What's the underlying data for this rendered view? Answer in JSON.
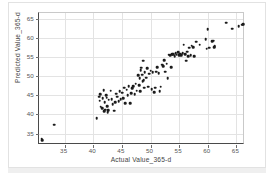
{
  "chart_data": {
    "type": "scatter",
    "title": "",
    "xlabel": "Actual Value_365-d",
    "ylabel": "Predicted Value_365-d",
    "xlim": [
      30.5,
      66.5
    ],
    "ylim": [
      32.0,
      66.5
    ],
    "xticks": [
      35,
      40,
      45,
      50,
      55,
      60,
      65
    ],
    "yticks": [
      35,
      40,
      45,
      50,
      55,
      60,
      65
    ],
    "grid": true,
    "legend": "none",
    "marker": "filled-circle",
    "marker_color": "#1b1b1b",
    "points": [
      [
        31.0,
        33.6
      ],
      [
        31.1,
        33.3
      ],
      [
        33.2,
        37.3
      ],
      [
        40.6,
        39.0
      ],
      [
        41.0,
        44.6
      ],
      [
        41.1,
        43.6
      ],
      [
        41.2,
        45.2
      ],
      [
        41.3,
        42.0
      ],
      [
        41.5,
        41.6
      ],
      [
        41.6,
        44.2
      ],
      [
        41.8,
        46.3
      ],
      [
        41.9,
        40.9
      ],
      [
        42.0,
        43.2
      ],
      [
        42.1,
        41.2
      ],
      [
        42.2,
        45.0
      ],
      [
        42.3,
        44.4
      ],
      [
        42.4,
        42.2
      ],
      [
        42.5,
        40.6
      ],
      [
        42.6,
        41.1
      ],
      [
        42.7,
        43.8
      ],
      [
        43.0,
        46.2
      ],
      [
        43.2,
        44.0
      ],
      [
        43.4,
        42.6
      ],
      [
        43.6,
        41.0
      ],
      [
        43.8,
        43.2
      ],
      [
        44.0,
        45.4
      ],
      [
        44.2,
        44.6
      ],
      [
        44.4,
        43.4
      ],
      [
        44.6,
        46.0
      ],
      [
        44.8,
        44.0
      ],
      [
        45.0,
        45.7
      ],
      [
        45.2,
        44.3
      ],
      [
        45.4,
        47.0
      ],
      [
        45.6,
        43.0
      ],
      [
        45.8,
        46.5
      ],
      [
        46.0,
        45.0
      ],
      [
        46.2,
        47.4
      ],
      [
        46.4,
        42.9
      ],
      [
        46.6,
        45.6
      ],
      [
        46.8,
        46.8
      ],
      [
        47.0,
        47.3
      ],
      [
        47.2,
        45.2
      ],
      [
        47.4,
        48.0
      ],
      [
        47.6,
        46.2
      ],
      [
        47.8,
        50.2
      ],
      [
        48.0,
        47.6
      ],
      [
        48.1,
        49.4
      ],
      [
        48.2,
        46.0
      ],
      [
        48.3,
        51.6
      ],
      [
        48.4,
        52.2
      ],
      [
        48.5,
        50.4
      ],
      [
        48.6,
        48.6
      ],
      [
        48.7,
        54.0
      ],
      [
        48.8,
        49.0
      ],
      [
        48.9,
        47.0
      ],
      [
        49.0,
        51.0
      ],
      [
        49.2,
        49.6
      ],
      [
        49.4,
        52.0
      ],
      [
        49.6,
        47.2
      ],
      [
        49.8,
        50.6
      ],
      [
        50.0,
        51.4
      ],
      [
        50.2,
        46.6
      ],
      [
        50.4,
        51.0
      ],
      [
        50.6,
        45.8
      ],
      [
        50.8,
        47.0
      ],
      [
        51.0,
        51.2
      ],
      [
        51.2,
        52.4
      ],
      [
        51.4,
        50.8
      ],
      [
        51.6,
        46.0
      ],
      [
        51.8,
        47.2
      ],
      [
        52.0,
        53.0
      ],
      [
        52.2,
        52.6
      ],
      [
        52.4,
        54.2
      ],
      [
        52.6,
        51.2
      ],
      [
        52.8,
        53.2
      ],
      [
        53.0,
        49.4
      ],
      [
        53.2,
        55.6
      ],
      [
        53.4,
        55.4
      ],
      [
        53.6,
        52.4
      ],
      [
        53.8,
        55.8
      ],
      [
        54.0,
        55.7
      ],
      [
        54.2,
        55.2
      ],
      [
        54.4,
        56.0
      ],
      [
        54.6,
        55.6
      ],
      [
        54.8,
        56.2
      ],
      [
        55.0,
        55.4
      ],
      [
        55.2,
        55.9
      ],
      [
        55.4,
        55.5
      ],
      [
        55.6,
        56.0
      ],
      [
        55.8,
        58.2
      ],
      [
        56.0,
        55.8
      ],
      [
        56.2,
        54.0
      ],
      [
        56.4,
        56.4
      ],
      [
        56.6,
        55.2
      ],
      [
        56.8,
        57.4
      ],
      [
        57.0,
        55.4
      ],
      [
        57.2,
        58.0
      ],
      [
        57.4,
        57.6
      ],
      [
        57.6,
        55.2
      ],
      [
        58.0,
        59.0
      ],
      [
        58.6,
        58.2
      ],
      [
        59.6,
        59.6
      ],
      [
        59.8,
        57.2
      ],
      [
        60.0,
        62.3
      ],
      [
        60.2,
        57.4
      ],
      [
        60.8,
        59.2
      ],
      [
        61.0,
        59.3
      ],
      [
        61.1,
        57.6
      ],
      [
        61.2,
        57.8
      ],
      [
        63.2,
        64.0
      ],
      [
        64.3,
        62.4
      ],
      [
        65.4,
        63.0
      ],
      [
        66.0,
        63.4
      ],
      [
        66.2,
        63.6
      ]
    ]
  },
  "axes": {
    "x_tick_labels": [
      "35",
      "40",
      "45",
      "50",
      "55",
      "60",
      "65"
    ],
    "y_tick_labels": [
      "35",
      "40",
      "45",
      "50",
      "55",
      "60",
      "65"
    ]
  }
}
